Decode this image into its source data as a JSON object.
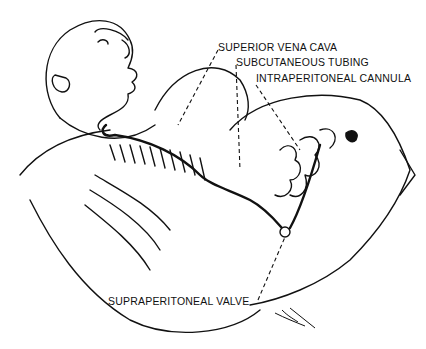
{
  "figure": {
    "labels": {
      "superior_vena_cava": "SUPERIOR VENA CAVA",
      "subcutaneous_tubing": "SUBCUTANEOUS TUBING",
      "intraperitoneal_cannula": "INTRAPERITONEAL CANNULA",
      "supraperitoneal_valve": "SUPRAPERITONEAL VALVE"
    },
    "colors": {
      "ink": "#111111",
      "background": "#ffffff"
    }
  }
}
